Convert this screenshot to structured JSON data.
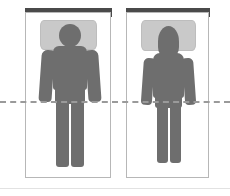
{
  "figure": {
    "panel_count": 2,
    "reference_line": {
      "name": "hip-alignment-line",
      "style": "dashed",
      "color": "#9a9a9a",
      "orientation": "horizontal",
      "y_position_px": 101,
      "spans_full_width": true,
      "label": ""
    },
    "palette": {
      "body": "#6e6e6e",
      "pillow": "#c9c9c9",
      "headboard": "#4a4a4a",
      "bed": "#ffffff",
      "panel_border": "#b7b7b7",
      "dashed_line": "#9a9a9a"
    },
    "panels": [
      {
        "id": "left",
        "name": "panel-left",
        "caption": "",
        "headboard_label": "headboard",
        "bed_label": "mattress",
        "pillow_label": "pillow",
        "person": {
          "label": "person-supine",
          "head_shape": "round",
          "head_on_pillow": true,
          "torso_width": "wide",
          "arms": [
            "left-arm",
            "right-arm"
          ],
          "legs": [
            "left-leg",
            "right-leg"
          ],
          "alignment": "flat"
        }
      },
      {
        "id": "right",
        "name": "panel-right",
        "caption": "",
        "headboard_label": "headboard",
        "bed_label": "mattress",
        "pillow_label": "pillow",
        "person": {
          "label": "person-supine-elevated",
          "head_shape": "oval",
          "head_on_pillow": true,
          "torso_width": "narrow",
          "arms": [
            "left-arm",
            "right-arm"
          ],
          "legs": [
            "left-leg",
            "right-leg"
          ],
          "alignment": "elevated"
        }
      }
    ]
  }
}
